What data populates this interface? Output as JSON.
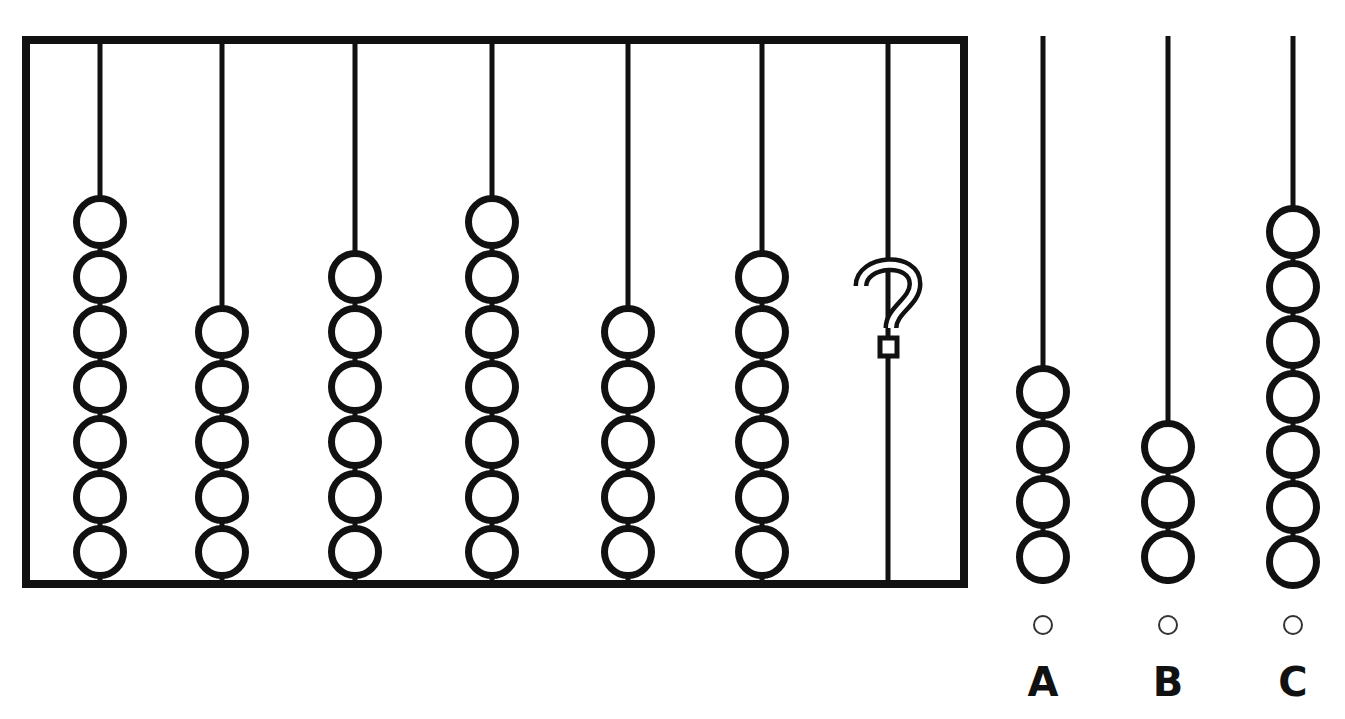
{
  "puzzle": {
    "type": "abacus-sequence-pattern",
    "prompt_symbol": "?",
    "frame": {
      "x": 22,
      "y": 36,
      "width": 946,
      "height": 552,
      "stroke": "#111111",
      "stroke_width": 8,
      "fill": "#ffffff"
    },
    "bead": {
      "diameter": 54,
      "pitch": 55,
      "stroke_width": 7,
      "stroke": "#111111",
      "fill": "#ffffff"
    },
    "rod": {
      "stroke": "#111111",
      "stroke_width": 5,
      "top_y": 40,
      "bottom_y": 584
    },
    "question_rod": {
      "index": 7,
      "x": 888,
      "bead_count": null,
      "marker": "?",
      "marker_center_x": 888,
      "marker_center_y": 312
    },
    "rods": [
      {
        "index": 1,
        "x": 100,
        "bead_count": 7,
        "top_bead_center_y": 222
      },
      {
        "index": 2,
        "x": 222,
        "bead_count": 5,
        "top_bead_center_y": 332
      },
      {
        "index": 3,
        "x": 355,
        "bead_count": 6,
        "top_bead_center_y": 277
      },
      {
        "index": 4,
        "x": 492,
        "bead_count": 7,
        "top_bead_center_y": 222
      },
      {
        "index": 5,
        "x": 628,
        "bead_count": 5,
        "top_bead_center_y": 332
      },
      {
        "index": 6,
        "x": 762,
        "bead_count": 6,
        "top_bead_center_y": 277
      },
      {
        "index": 7,
        "x": 888,
        "bead_count": 0,
        "top_bead_center_y": null
      }
    ],
    "bead_counts_sequence": [
      7,
      5,
      6,
      7,
      5,
      6
    ]
  },
  "options": {
    "radio": {
      "diameter": 20,
      "center_y": 625,
      "stroke": "#333333",
      "stroke_width": 2,
      "fill": "#ffffff",
      "selected": null
    },
    "items": [
      {
        "id": "A",
        "label": "A",
        "rod_x": 1043,
        "bead_count": 4,
        "top_bead_center_y": 392,
        "radio_center_x": 1043,
        "selected": false
      },
      {
        "id": "B",
        "label": "B",
        "rod_x": 1168,
        "bead_count": 3,
        "top_bead_center_y": 447,
        "radio_center_x": 1168,
        "selected": false
      },
      {
        "id": "C",
        "label": "C",
        "rod_x": 1293,
        "bead_count": 7,
        "top_bead_center_y": 232,
        "radio_center_x": 1293,
        "selected": false
      }
    ]
  },
  "canvas": {
    "width": 1345,
    "height": 719,
    "background": "#ffffff"
  }
}
